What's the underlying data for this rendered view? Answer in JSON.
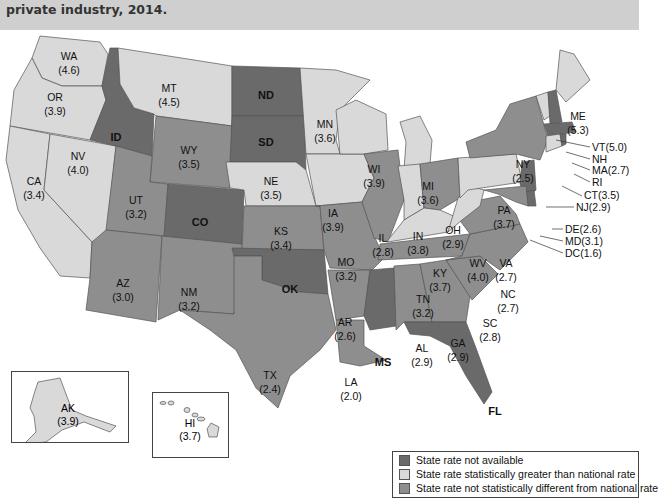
{
  "header": {
    "title": "private industry, 2014."
  },
  "legend": {
    "items": [
      {
        "label": "State rate not available",
        "color": "#6a6a6a"
      },
      {
        "label": "State rate statistically greater than national rate",
        "color": "#d9d9d9"
      },
      {
        "label": "State rate not statistically different from national rate",
        "color": "#8e8e8e"
      }
    ]
  },
  "states": {
    "WA": {
      "abbr": "WA",
      "value": "(4.6)",
      "category": "greater"
    },
    "OR": {
      "abbr": "OR",
      "value": "(3.9)",
      "category": "greater"
    },
    "CA": {
      "abbr": "CA",
      "value": "(3.4)",
      "category": "greater"
    },
    "NV": {
      "abbr": "NV",
      "value": "(4.0)",
      "category": "greater"
    },
    "ID": {
      "abbr": "ID",
      "value": "",
      "category": "not_available"
    },
    "MT": {
      "abbr": "MT",
      "value": "(4.5)",
      "category": "greater"
    },
    "WY": {
      "abbr": "WY",
      "value": "(3.5)",
      "category": "not_different"
    },
    "UT": {
      "abbr": "UT",
      "value": "(3.2)",
      "category": "not_different"
    },
    "AZ": {
      "abbr": "AZ",
      "value": "(3.0)",
      "category": "not_different"
    },
    "CO": {
      "abbr": "CO",
      "value": "",
      "category": "not_available"
    },
    "NM": {
      "abbr": "NM",
      "value": "(3.2)",
      "category": "not_different"
    },
    "ND": {
      "abbr": "ND",
      "value": "",
      "category": "not_available"
    },
    "SD": {
      "abbr": "SD",
      "value": "",
      "category": "not_available"
    },
    "NE": {
      "abbr": "NE",
      "value": "(3.5)",
      "category": "greater"
    },
    "KS": {
      "abbr": "KS",
      "value": "(3.4)",
      "category": "not_different"
    },
    "OK": {
      "abbr": "OK",
      "value": "",
      "category": "not_available"
    },
    "TX": {
      "abbr": "TX",
      "value": "(2.4)",
      "category": "not_different"
    },
    "MN": {
      "abbr": "MN",
      "value": "(3.6)",
      "category": "greater"
    },
    "IA": {
      "abbr": "IA",
      "value": "(3.9)",
      "category": "greater"
    },
    "MO": {
      "abbr": "MO",
      "value": "(3.2)",
      "category": "not_different"
    },
    "AR": {
      "abbr": "AR",
      "value": "(2.6)",
      "category": "not_different"
    },
    "LA": {
      "abbr": "LA",
      "value": "(2.0)",
      "category": "not_different"
    },
    "WI": {
      "abbr": "WI",
      "value": "(3.9)",
      "category": "greater"
    },
    "IL": {
      "abbr": "IL",
      "value": "(2.8)",
      "category": "not_different"
    },
    "MI": {
      "abbr": "MI",
      "value": "(3.6)",
      "category": "greater"
    },
    "IN": {
      "abbr": "IN",
      "value": "(3.8)",
      "category": "greater"
    },
    "OH": {
      "abbr": "OH",
      "value": "(2.9)",
      "category": "not_different"
    },
    "KY": {
      "abbr": "KY",
      "value": "(3.7)",
      "category": "greater"
    },
    "TN": {
      "abbr": "TN",
      "value": "(3.2)",
      "category": "not_different"
    },
    "MS": {
      "abbr": "MS",
      "value": "",
      "category": "not_available"
    },
    "AL": {
      "abbr": "AL",
      "value": "(2.9)",
      "category": "not_different"
    },
    "GA": {
      "abbr": "GA",
      "value": "(2.9)",
      "category": "not_different"
    },
    "FL": {
      "abbr": "FL",
      "value": "",
      "category": "not_available"
    },
    "SC": {
      "abbr": "SC",
      "value": "(2.8)",
      "category": "not_different"
    },
    "NC": {
      "abbr": "NC",
      "value": "(2.7)",
      "category": "not_different"
    },
    "VA": {
      "abbr": "VA",
      "value": "(2.7)",
      "category": "not_different"
    },
    "WV": {
      "abbr": "WV",
      "value": "(4.0)",
      "category": "greater"
    },
    "PA": {
      "abbr": "PA",
      "value": "(3.7)",
      "category": "greater"
    },
    "NY": {
      "abbr": "NY",
      "value": "(2.5)",
      "category": "not_different"
    },
    "ME": {
      "abbr": "ME",
      "value": "(5.3)",
      "category": "greater"
    },
    "AK": {
      "abbr": "AK",
      "value": "(3.9)",
      "category": "greater"
    },
    "HI": {
      "abbr": "HI",
      "value": "(3.7)",
      "category": "greater"
    }
  },
  "callouts": {
    "VT": "VT(5.0)",
    "NH": "NH",
    "MA": "MA(2.7)",
    "RI": "RI",
    "CT": "CT(3.5)",
    "NJ": "NJ(2.9)",
    "DE": "DE(2.6)",
    "MD": "MD(3.1)",
    "DC": "DC(1.6)"
  }
}
